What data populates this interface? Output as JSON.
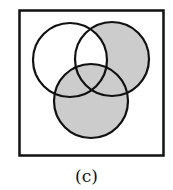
{
  "figure": {
    "label": "(c)",
    "type": "venn-diagram",
    "sets": [
      "A",
      "B",
      "C"
    ],
    "shaded_region": "(B ∪ C) minus (A ∩ B not in C)",
    "colors": {
      "shade": "#cccccc",
      "stroke": "#111111",
      "background": "#ffffff"
    }
  }
}
